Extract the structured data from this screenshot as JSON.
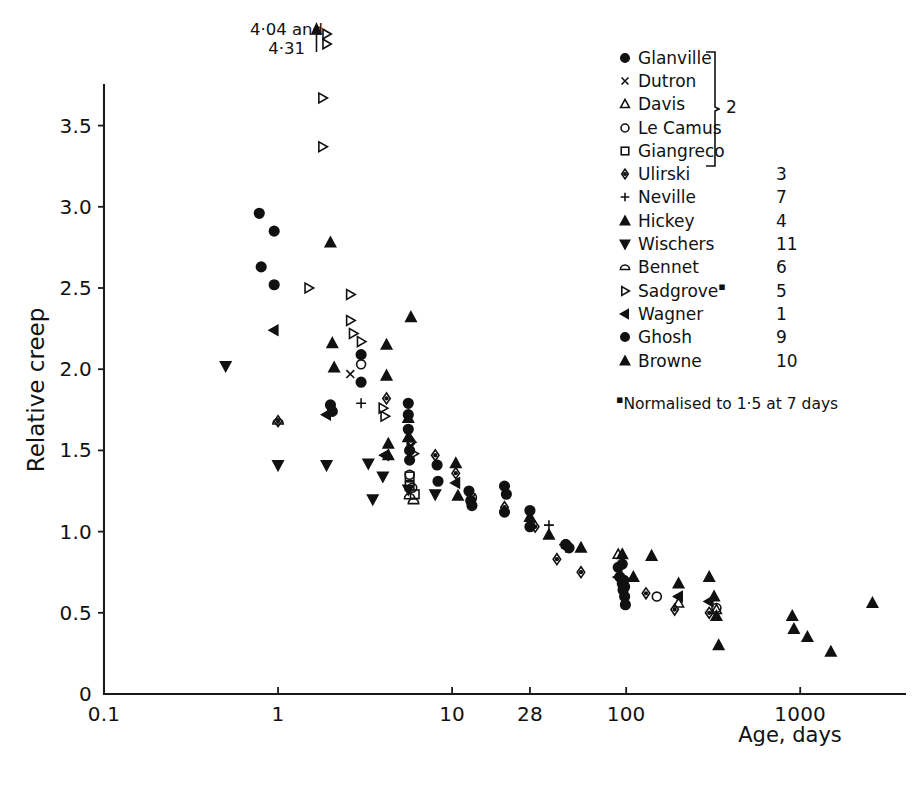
{
  "figure": {
    "title": "",
    "background": "#ffffff",
    "ink_color": "#111111"
  },
  "axes": {
    "x": {
      "label": "Age, days",
      "scale": "log",
      "ticks": [
        "0.1",
        "1",
        "10",
        "28",
        "100",
        "1000"
      ],
      "tick_values": [
        0.1,
        1,
        10,
        28,
        100,
        1000
      ],
      "range": [
        0.1,
        4000
      ]
    },
    "y": {
      "label": "Relative creep",
      "scale": "linear",
      "ticks": [
        "0",
        "0.5",
        "1.0",
        "1.5",
        "2.0",
        "2.5",
        "3.0",
        "3.5"
      ],
      "tick_values": [
        0,
        0.5,
        1.0,
        1.5,
        2.0,
        2.5,
        3.0,
        3.5
      ],
      "range": [
        0,
        3.75
      ]
    }
  },
  "annotation": {
    "arrow": "up-arrow",
    "marker": "B",
    "line1": "4·04 and",
    "line2": "4·31",
    "at_x": 1.8
  },
  "legend": {
    "brace_label": "2",
    "footnote_mark": "▪",
    "footnote": "Normalised to 1·5 at 7 days",
    "entries": [
      {
        "label": "Glanville",
        "ref": "2",
        "marker": "filled-circle",
        "braced": true
      },
      {
        "label": "Dutron",
        "ref": "2",
        "marker": "cross",
        "braced": true
      },
      {
        "label": "Davis",
        "ref": "2",
        "marker": "open-triangle-up",
        "braced": true
      },
      {
        "label": "Le Camus",
        "ref": "2",
        "marker": "open-circle",
        "braced": true
      },
      {
        "label": "Giangreco",
        "ref": "2",
        "marker": "open-square",
        "braced": true
      },
      {
        "label": "Ulirski",
        "ref": "3",
        "marker": "dotted-diamond",
        "braced": false
      },
      {
        "label": "Neville",
        "ref": "7",
        "marker": "plus",
        "braced": false
      },
      {
        "label": "Hickey",
        "ref": "4",
        "marker": "filled-triangle-up",
        "braced": false
      },
      {
        "label": "Wischers",
        "ref": "11",
        "marker": "filled-triangle-down",
        "braced": false
      },
      {
        "label": "Bennet",
        "ref": "6",
        "marker": "half-circle",
        "braced": false
      },
      {
        "label": "Sadgrove",
        "ref": "5",
        "marker": "open-triangle-right",
        "braced": false,
        "superscript": "▪"
      },
      {
        "label": "Wagner",
        "ref": "1",
        "marker": "filled-triangle-left",
        "braced": false
      },
      {
        "label": "Ghosh",
        "ref": "9",
        "marker": "filled-circle",
        "braced": false
      },
      {
        "label": "Browne",
        "ref": "10",
        "marker": "filled-triangle-up",
        "braced": false
      }
    ]
  },
  "chart_data": {
    "type": "scatter",
    "title": "",
    "xlabel": "Age, days",
    "ylabel": "Relative creep",
    "xscale": "log",
    "yscale": "linear",
    "xlim": [
      0.1,
      4000
    ],
    "ylim": [
      0,
      3.75
    ],
    "grid": false,
    "legend_position": "top-right",
    "xticks": [
      0.1,
      1,
      10,
      28,
      100,
      1000
    ],
    "yticks": [
      0,
      0.5,
      1.0,
      1.5,
      2.0,
      2.5,
      3.0,
      3.5
    ],
    "series": [
      {
        "name": "Glanville",
        "ref": "2",
        "marker": "filled-circle",
        "points": [
          [
            0.78,
            2.96
          ],
          [
            0.95,
            2.85
          ],
          [
            0.8,
            2.63
          ],
          [
            0.95,
            2.52
          ],
          [
            2.0,
            1.78
          ],
          [
            2.05,
            1.74
          ],
          [
            3.0,
            2.09
          ],
          [
            3.0,
            1.92
          ],
          [
            5.6,
            1.79
          ],
          [
            5.6,
            1.72
          ],
          [
            5.6,
            1.63
          ],
          [
            5.7,
            1.5
          ],
          [
            5.7,
            1.44
          ],
          [
            8.2,
            1.41
          ],
          [
            8.3,
            1.31
          ],
          [
            12.5,
            1.25
          ],
          [
            12.8,
            1.19
          ],
          [
            13.0,
            1.16
          ],
          [
            20.0,
            1.12
          ],
          [
            28.0,
            1.03
          ],
          [
            45.0,
            0.92
          ],
          [
            47.0,
            0.9
          ],
          [
            90.0,
            0.78
          ],
          [
            92.0,
            0.72
          ],
          [
            95.0,
            0.68
          ],
          [
            96.0,
            0.64
          ],
          [
            98.0,
            0.6
          ],
          [
            99.0,
            0.55
          ]
        ]
      },
      {
        "name": "Dutron",
        "ref": "2",
        "marker": "cross",
        "points": [
          [
            2.6,
            1.97
          ],
          [
            5.8,
            1.52
          ],
          [
            13.0,
            1.21
          ]
        ]
      },
      {
        "name": "Davis",
        "ref": "2",
        "marker": "open-triangle-up",
        "points": [
          [
            90.0,
            0.86
          ],
          [
            200.0,
            0.56
          ],
          [
            330.0,
            0.52
          ]
        ]
      },
      {
        "name": "Le Camus",
        "ref": "2",
        "marker": "open-circle",
        "points": [
          [
            3.0,
            2.03
          ],
          [
            5.7,
            1.35
          ],
          [
            5.9,
            1.27
          ],
          [
            13.0,
            1.21
          ],
          [
            150.0,
            0.6
          ],
          [
            330.0,
            0.53
          ]
        ]
      },
      {
        "name": "Giangreco",
        "ref": "2",
        "marker": "open-square",
        "points": [
          [
            5.7,
            1.34
          ],
          [
            5.7,
            1.28
          ],
          [
            6.1,
            1.23
          ]
        ]
      },
      {
        "name": "Ulirski",
        "ref": "3",
        "marker": "dotted-diamond",
        "points": [
          [
            1.0,
            1.68
          ],
          [
            4.2,
            1.82
          ],
          [
            5.8,
            1.56
          ],
          [
            8.0,
            1.47
          ],
          [
            10.5,
            1.36
          ],
          [
            20.0,
            1.15
          ],
          [
            30.0,
            1.03
          ],
          [
            40.0,
            0.83
          ],
          [
            55.0,
            0.75
          ],
          [
            130.0,
            0.62
          ],
          [
            190.0,
            0.52
          ],
          [
            300.0,
            0.5
          ]
        ]
      },
      {
        "name": "Neville",
        "ref": "7",
        "marker": "plus",
        "points": [
          [
            3.0,
            1.79
          ],
          [
            36.0,
            1.04
          ],
          [
            44.0,
            0.92
          ],
          [
            45.0,
            0.9
          ]
        ]
      },
      {
        "name": "Hickey",
        "ref": "4",
        "marker": "filled-triangle-up",
        "points": [
          [
            2.0,
            2.78
          ],
          [
            2.05,
            2.16
          ],
          [
            2.1,
            2.01
          ],
          [
            4.2,
            2.15
          ],
          [
            4.2,
            1.96
          ],
          [
            4.3,
            1.54
          ],
          [
            4.3,
            1.47
          ],
          [
            5.6,
            1.7
          ],
          [
            5.6,
            1.58
          ]
        ]
      },
      {
        "name": "Wischers",
        "ref": "11",
        "marker": "filled-triangle-down",
        "points": [
          [
            0.5,
            2.02
          ],
          [
            1.0,
            1.41
          ],
          [
            1.9,
            1.41
          ],
          [
            3.3,
            1.42
          ],
          [
            3.5,
            1.2
          ],
          [
            4.0,
            1.34
          ],
          [
            5.6,
            1.26
          ],
          [
            8.0,
            1.23
          ]
        ]
      },
      {
        "name": "Bennet",
        "ref": "6",
        "marker": "half-circle",
        "points": [
          [
            1.0,
            1.68
          ],
          [
            5.7,
            1.22
          ],
          [
            6.0,
            1.19
          ]
        ]
      },
      {
        "name": "Sadgrove",
        "ref": "5",
        "marker": "open-triangle-right",
        "points": [
          [
            1.8,
            3.67
          ],
          [
            1.8,
            3.37
          ],
          [
            1.5,
            2.5
          ],
          [
            2.6,
            2.46
          ],
          [
            2.6,
            2.3
          ],
          [
            2.7,
            2.22
          ],
          [
            3.0,
            2.17
          ],
          [
            4.0,
            1.76
          ],
          [
            4.1,
            1.71
          ],
          [
            5.8,
            1.55
          ],
          [
            6.0,
            1.48
          ]
        ]
      },
      {
        "name": "Wagner",
        "ref": "1",
        "marker": "filled-triangle-left",
        "points": [
          [
            0.95,
            2.24
          ],
          [
            1.9,
            1.72
          ],
          [
            4.1,
            1.47
          ],
          [
            10.5,
            1.3
          ],
          [
            90.0,
            0.72
          ],
          [
            200.0,
            0.6
          ],
          [
            300.0,
            0.57
          ]
        ]
      },
      {
        "name": "Ghosh",
        "ref": "9",
        "marker": "filled-circle",
        "points": [
          [
            20.0,
            1.28
          ],
          [
            20.5,
            1.23
          ],
          [
            28.0,
            1.13
          ],
          [
            45.0,
            0.92
          ],
          [
            95.0,
            0.8
          ],
          [
            97.0,
            0.7
          ],
          [
            98.0,
            0.66
          ]
        ]
      },
      {
        "name": "Browne",
        "ref": "10",
        "marker": "filled-triangle-up",
        "points": [
          [
            5.8,
            2.32
          ],
          [
            10.5,
            1.42
          ],
          [
            10.8,
            1.22
          ],
          [
            28.0,
            1.09
          ],
          [
            36.0,
            0.98
          ],
          [
            55.0,
            0.9
          ],
          [
            95.0,
            0.86
          ],
          [
            110.0,
            0.72
          ],
          [
            140.0,
            0.85
          ],
          [
            200.0,
            0.68
          ],
          [
            300.0,
            0.72
          ],
          [
            320.0,
            0.6
          ],
          [
            330.0,
            0.48
          ],
          [
            340.0,
            0.3
          ],
          [
            900.0,
            0.48
          ],
          [
            920.0,
            0.4
          ],
          [
            1100.0,
            0.35
          ],
          [
            1500.0,
            0.26
          ],
          [
            2600.0,
            0.56
          ]
        ]
      }
    ],
    "off_scale_annotation": {
      "text": "4·04 and 4·31",
      "series": "Sadgrove",
      "at_x": 1.8,
      "values": [
        4.04,
        4.31
      ]
    }
  }
}
